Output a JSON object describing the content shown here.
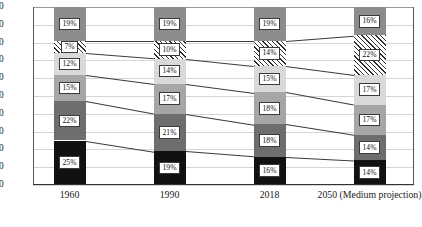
{
  "chart_data": {
    "type": "bar",
    "subtype": "stacked-bar-with-connectors",
    "title": "",
    "xlabel": "",
    "ylabel": "",
    "ylim": [
      0,
      100
    ],
    "yticks": [
      0,
      10,
      20,
      30,
      40,
      50,
      60,
      70,
      80,
      90,
      100
    ],
    "grid": true,
    "legend": "none",
    "categories": [
      "1960",
      "1990",
      "2018",
      "2050 (Medium projection)"
    ],
    "series": [
      {
        "name": "segment-6-top",
        "fill": "#8c8c8c",
        "values": [
          19,
          19,
          19,
          16
        ]
      },
      {
        "name": "segment-5-hatched",
        "fill": "hatch",
        "values": [
          7,
          10,
          14,
          22
        ]
      },
      {
        "name": "segment-4",
        "fill": "#d9d9d9",
        "values": [
          12,
          14,
          15,
          17
        ]
      },
      {
        "name": "segment-3",
        "fill": "#a6a6a6",
        "values": [
          15,
          17,
          18,
          17
        ]
      },
      {
        "name": "segment-2",
        "fill": "#6e6e6e",
        "values": [
          22,
          21,
          18,
          14
        ]
      },
      {
        "name": "segment-1-bottom",
        "fill": "#111111",
        "values": [
          25,
          19,
          16,
          14
        ]
      }
    ],
    "stack_order_bottom_to_top": [
      "segment-1-bottom",
      "segment-2",
      "segment-3",
      "segment-4",
      "segment-5-hatched",
      "segment-6-top"
    ],
    "data_labels": {
      "1960": [
        "25%",
        "22%",
        "15%",
        "12%",
        "7%",
        "19%"
      ],
      "1990": [
        "19%",
        "21%",
        "17%",
        "14%",
        "10%",
        "19%"
      ],
      "2018": [
        "16%",
        "18%",
        "18%",
        "15%",
        "14%",
        "19%"
      ],
      "2050 (Medium projection)": [
        "14%",
        "14%",
        "17%",
        "17%",
        "22%",
        "16%"
      ]
    },
    "cumulative_boundaries": {
      "1960": [
        0,
        25,
        47,
        62,
        74,
        81,
        100
      ],
      "1990": [
        0,
        19,
        40,
        57,
        71,
        81,
        100
      ],
      "2018": [
        0,
        16,
        34,
        52,
        67,
        81,
        100
      ],
      "2050 (Medium projection)": [
        0,
        14,
        28,
        45,
        62,
        84,
        100
      ]
    }
  },
  "axis": {
    "y_tick_labels": [
      "100",
      "90",
      "80",
      "70",
      "60",
      "50",
      "40",
      "30",
      "20",
      "10",
      "0"
    ],
    "x_tick_labels": [
      "1960",
      "1990",
      "2018",
      "2050 (Medium projection)"
    ]
  },
  "colors": {
    "segment_top": "#8c8c8c",
    "segment_hatch_ink": "#2e2e2e",
    "segment_light": "#d9d9d9",
    "segment_mid": "#a6a6a6",
    "segment_dark": "#6e6e6e",
    "segment_black": "#111111",
    "gridline": "#d6d6d6",
    "axis": "#333333",
    "connector": "#3b3b3b"
  }
}
